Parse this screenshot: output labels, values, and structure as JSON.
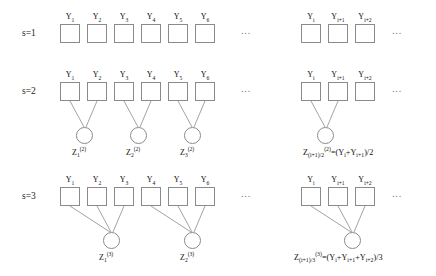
{
  "rows": [
    {
      "scale_label": "s=1",
      "boxes_left": [
        "Y₁",
        "Y₂",
        "Y₃",
        "Y₄",
        "Y₅",
        "Y₆"
      ],
      "boxes_right": [
        "Yᵢ",
        "Yᵢ₊₁",
        "Yᵢ₊₂"
      ],
      "circles_left": [],
      "circles_right": [],
      "formula": ""
    },
    {
      "scale_label": "s=2",
      "boxes_left": [
        "Y₁",
        "Y₂",
        "Y₃",
        "Y₄",
        "Y₅",
        "Y₆"
      ],
      "boxes_right": [
        "Yᵢ",
        "Yᵢ₊₁",
        "Yᵢ₊₂"
      ],
      "circles_left": [
        "Z₁(2)",
        "Z₂(2)",
        "Z₃(2)"
      ],
      "circles_right": [
        "Z(i+1)/2 (2)"
      ],
      "formula": "Z(i+1)/2(2)=(Yi+Yi+1)/2"
    },
    {
      "scale_label": "s=3",
      "boxes_left": [
        "Y₁",
        "Y₂",
        "Y₃",
        "Y₄",
        "Y₅",
        "Y₆"
      ],
      "boxes_right": [
        "Yᵢ",
        "Yᵢ₊₁",
        "Yᵢ₊₂"
      ],
      "circles_left": [
        "Z₁(3)",
        "Z₂(3)"
      ],
      "circles_right": [
        "Z(i+1)/3 (3)"
      ],
      "formula": "Z(i+1)/3(3)=(Yi+Yi+1+Yi+2)/3"
    }
  ],
  "labels": {
    "scale1": "s=1",
    "scale2": "s=2",
    "scale3": "s=3",
    "y_base": "Y",
    "z_base": "Z",
    "ellipsis": "∙∙∙",
    "y_subs_left": [
      "1",
      "2",
      "3",
      "4",
      "5",
      "6"
    ],
    "y_subs_right": [
      "i",
      "i+1",
      "i+2"
    ],
    "z2_subs_left": [
      "1",
      "2",
      "3"
    ],
    "z3_subs_left": [
      "1",
      "2"
    ],
    "z2_sup": "(2)",
    "z3_sup": "(3)"
  },
  "formulas": {
    "row2": {
      "z_base": "Z",
      "z_sub": "(i+1)/2",
      "z_sup": "(2)",
      "rhs": "=(Y",
      "rhs_sub1": "i",
      "rhs_mid": "+Y",
      "rhs_sub2": "i+1",
      "rhs_tail": ")/2"
    },
    "row3": {
      "z_base": "Z",
      "z_sub": "(i+1)/3",
      "z_sup": "(3)",
      "rhs": "=(Y",
      "rhs_sub1": "i",
      "rhs_mid": "+Y",
      "rhs_sub2": "i+1",
      "rhs_mid2": "+Y",
      "rhs_sub3": "i+2",
      "rhs_tail": ")/3"
    }
  },
  "colors": {
    "stroke": "#8a8a8a",
    "text": "#111111",
    "background": "#ffffff"
  }
}
